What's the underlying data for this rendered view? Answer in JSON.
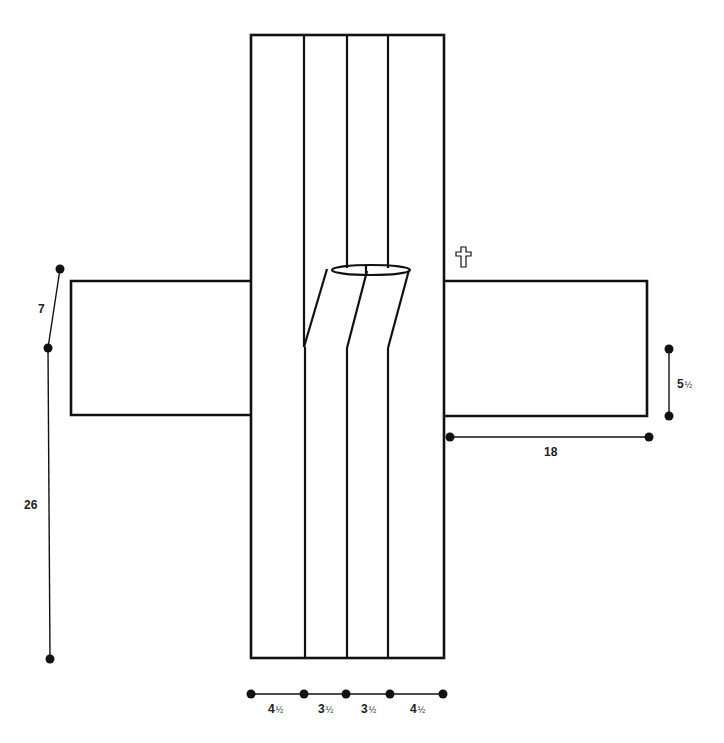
{
  "diagram": {
    "type": "pattern-layout",
    "colors": {
      "line": "#111111",
      "background": "#ffffff"
    },
    "symbol": {
      "name": "cross-symbol",
      "glyph": "✞"
    },
    "dimensions": {
      "left_upper": {
        "label": "7"
      },
      "left_lower": {
        "label": "26"
      },
      "right_arm_height": {
        "label": "5",
        "fraction": "½"
      },
      "right_arm_width": {
        "label": "18"
      },
      "strips": [
        {
          "label": "4",
          "fraction": "½"
        },
        {
          "label": "3",
          "fraction": "½"
        },
        {
          "label": "3",
          "fraction": "½"
        },
        {
          "label": "4",
          "fraction": "½"
        }
      ]
    }
  }
}
